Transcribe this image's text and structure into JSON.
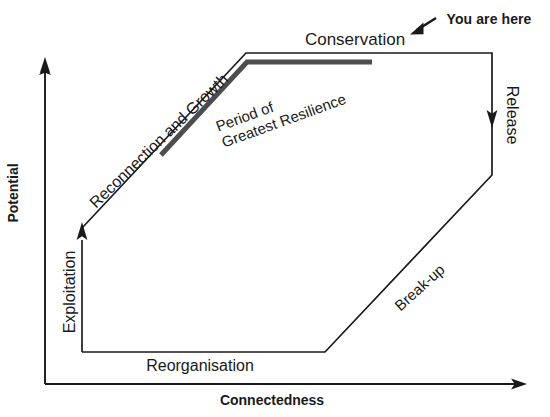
{
  "figure": {
    "type": "adaptive-cycle-diagram",
    "axes": {
      "y_label": "Potential",
      "x_label": "Connectedness"
    },
    "phases": [
      {
        "id": "exploitation",
        "label": "Exploitation"
      },
      {
        "id": "reorganisation",
        "label": "Reorganisation"
      },
      {
        "id": "conservation",
        "label": "Conservation"
      },
      {
        "id": "release",
        "label": "Release"
      }
    ],
    "annotations": [
      {
        "id": "reconnection",
        "label": "Reconnection and Growth"
      },
      {
        "id": "resilience_line1",
        "label": "Period of"
      },
      {
        "id": "resilience_line2",
        "label": "Greatest Resilience"
      },
      {
        "id": "breakup",
        "label": "Break-up"
      },
      {
        "id": "you_are_here",
        "label": "You are here"
      }
    ],
    "colors": {
      "line": "#1a1a1a",
      "highlight": "#4d4d4d",
      "background": "#ffffff"
    }
  }
}
